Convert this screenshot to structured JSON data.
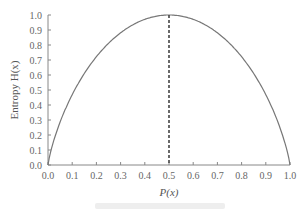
{
  "chart_data": {
    "type": "line",
    "title": "",
    "xlabel": "P(x)",
    "ylabel": "Entropy H(x)",
    "xlim": [
      0.0,
      1.0
    ],
    "ylim": [
      0.0,
      1.0
    ],
    "x_ticks": [
      "0.0",
      "0.1",
      "0.2",
      "0.3",
      "0.4",
      "0.5",
      "0.6",
      "0.7",
      "0.8",
      "0.9",
      "1.0"
    ],
    "y_ticks": [
      "0.0",
      "0.1",
      "0.2",
      "0.3",
      "0.4",
      "0.5",
      "0.6",
      "0.7",
      "0.8",
      "0.9",
      "1.0"
    ],
    "series": [
      {
        "name": "H(x)",
        "x": [
          0.0,
          0.01,
          0.05,
          0.1,
          0.2,
          0.3,
          0.4,
          0.5,
          0.6,
          0.7,
          0.8,
          0.9,
          0.95,
          0.99,
          1.0
        ],
        "values": [
          0.0,
          0.081,
          0.286,
          0.469,
          0.722,
          0.881,
          0.971,
          1.0,
          0.971,
          0.881,
          0.722,
          0.469,
          0.286,
          0.081,
          0.0
        ]
      }
    ],
    "annotations": [
      {
        "type": "vertical-dashed-line",
        "x": 0.5,
        "from_y": 0.0,
        "to_y": 1.0
      }
    ],
    "grid": false,
    "legend": null
  }
}
